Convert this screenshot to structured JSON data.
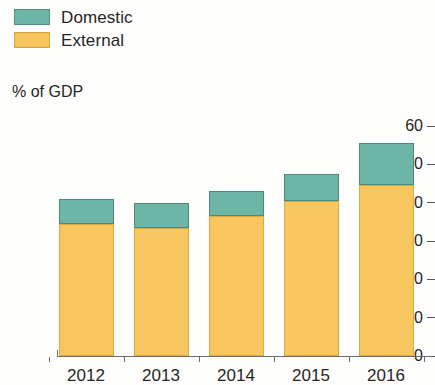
{
  "legend": {
    "items": [
      {
        "label": "Domestic",
        "color": "#6db5a6",
        "key": "domestic"
      },
      {
        "label": "External",
        "color": "#f8c65f",
        "key": "external"
      }
    ]
  },
  "chart_data": {
    "type": "bar",
    "stacked": true,
    "title": "",
    "subtitle": "",
    "xlabel": "",
    "ylabel": "% of GDP",
    "categories": [
      "2012",
      "2013",
      "2014",
      "2015",
      "2016"
    ],
    "series": [
      {
        "name": "External",
        "color": "#f8c65f",
        "values": [
          34.5,
          33.5,
          36.5,
          40.5,
          44.5
        ]
      },
      {
        "name": "Domestic",
        "color": "#6db5a6",
        "values": [
          6.5,
          6.5,
          6.5,
          7.0,
          11.0
        ]
      }
    ],
    "totals": [
      41.0,
      40.0,
      43.0,
      47.5,
      55.5
    ],
    "ylim": [
      0,
      60
    ],
    "yticks": [
      0,
      10,
      20,
      30,
      40,
      50,
      60
    ],
    "ytick_labels": [
      "0",
      "10",
      "20",
      "30",
      "40",
      "50",
      "60"
    ],
    "grid": false,
    "legend_position": "top-left"
  }
}
